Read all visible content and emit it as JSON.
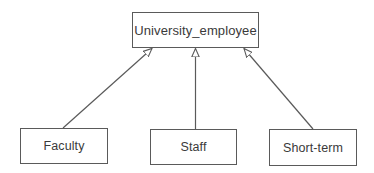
{
  "diagram": {
    "type": "uml-class-generalization",
    "parent": {
      "label": "University_employee"
    },
    "children": [
      {
        "label": "Faculty"
      },
      {
        "label": "Staff"
      },
      {
        "label": "Short-term"
      }
    ],
    "edges": [
      {
        "from": "Faculty",
        "to": "University_employee",
        "arrow": "hollow-triangle"
      },
      {
        "from": "Staff",
        "to": "University_employee",
        "arrow": "hollow-triangle"
      },
      {
        "from": "Short-term",
        "to": "University_employee",
        "arrow": "hollow-triangle"
      }
    ],
    "colors": {
      "line": "#5a5a5a",
      "text": "#3a3a3a",
      "background": "#ffffff"
    }
  }
}
